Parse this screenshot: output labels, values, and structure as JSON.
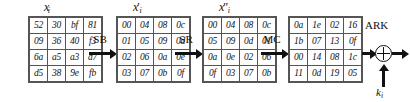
{
  "diagram": {
    "states": [
      {
        "id": "state-input",
        "label_base": "x",
        "label_prime": "",
        "label_sub": "i",
        "rows": [
          [
            "52",
            "30",
            "bf",
            "81"
          ],
          [
            "09",
            "36",
            "40",
            "f3"
          ],
          [
            "6a",
            "a5",
            "a3",
            "d7"
          ],
          [
            "d5",
            "38",
            "9e",
            "fb"
          ]
        ]
      },
      {
        "id": "state-after-subbytes",
        "label_base": "x",
        "label_prime": "′",
        "label_sub": "i",
        "rows": [
          [
            "00",
            "04",
            "08",
            "0c"
          ],
          [
            "01",
            "05",
            "09",
            "0d"
          ],
          [
            "02",
            "06",
            "0a",
            "0e"
          ],
          [
            "03",
            "07",
            "0b",
            "0f"
          ]
        ]
      },
      {
        "id": "state-after-shiftrows",
        "label_base": "x",
        "label_prime": "″",
        "label_sub": "i",
        "rows": [
          [
            "00",
            "04",
            "08",
            "0c"
          ],
          [
            "05",
            "09",
            "0d",
            "01"
          ],
          [
            "0a",
            "0e",
            "02",
            "06"
          ],
          [
            "0f",
            "03",
            "07",
            "0b"
          ]
        ]
      },
      {
        "id": "state-after-mixcolumns",
        "label_base": "",
        "label_prime": "",
        "label_sub": "",
        "rows": [
          [
            "0a",
            "1e",
            "02",
            "16"
          ],
          [
            "1b",
            "07",
            "13",
            "0f"
          ],
          [
            "00",
            "14",
            "08",
            "1c"
          ],
          [
            "11",
            "0d",
            "19",
            "05"
          ]
        ]
      }
    ],
    "operations": [
      {
        "id": "op-subbytes",
        "label": "SB"
      },
      {
        "id": "op-shiftrows",
        "label": "SR"
      },
      {
        "id": "op-mixcolumns",
        "label": "MC"
      },
      {
        "id": "op-addroundkey",
        "label": "ARK"
      }
    ],
    "key": {
      "base": "k",
      "sub": "i"
    },
    "colors": {
      "line": "#111111",
      "cell_border": "#555555",
      "background": "#ffffff"
    }
  }
}
